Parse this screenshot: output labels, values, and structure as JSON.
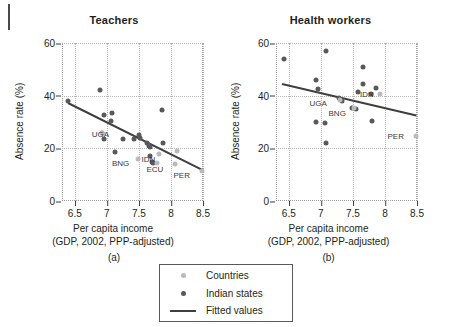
{
  "figure": {
    "legend": {
      "items": [
        {
          "label": "Countries",
          "marker": "dot",
          "color": "#b9babc"
        },
        {
          "label": "Indian states",
          "marker": "dot",
          "color": "#58595b"
        },
        {
          "label": "Fitted values",
          "marker": "line",
          "color": "#3f3f3f"
        }
      ]
    }
  },
  "chart_data": [
    {
      "type": "scatter",
      "title": "Teachers",
      "caption": "(a)",
      "xlabel": "Per capita income",
      "xlabel_line2": "(GDP, 2002, PPP-adjusted)",
      "ylabel": "Absence rate (%)",
      "xlim": [
        6.3,
        8.5
      ],
      "ylim": [
        0,
        60
      ],
      "xticks": [
        "6.5",
        "7",
        "7.5",
        "8",
        "8.5"
      ],
      "xtick_values": [
        6.5,
        7,
        7.5,
        8,
        8.5
      ],
      "yticks": [
        "0",
        "20",
        "40",
        "60"
      ],
      "ytick_values": [
        0,
        20,
        40,
        60
      ],
      "grid": "dotted",
      "series": [
        {
          "name": "Indian states",
          "color": "#58595b",
          "points": [
            {
              "x": 6.4,
              "y": 38.0
            },
            {
              "x": 6.9,
              "y": 42.0
            },
            {
              "x": 6.95,
              "y": 32.5
            },
            {
              "x": 7.08,
              "y": 33.5
            },
            {
              "x": 7.07,
              "y": 30.5
            },
            {
              "x": 6.93,
              "y": 26.0
            },
            {
              "x": 6.95,
              "y": 23.5
            },
            {
              "x": 7.12,
              "y": 18.5
            },
            {
              "x": 7.25,
              "y": 23.5
            },
            {
              "x": 7.42,
              "y": 23.5
            },
            {
              "x": 7.5,
              "y": 25.0
            },
            {
              "x": 7.52,
              "y": 24.0
            },
            {
              "x": 7.62,
              "y": 22.0
            },
            {
              "x": 7.66,
              "y": 21.0
            },
            {
              "x": 7.68,
              "y": 20.5
            },
            {
              "x": 7.68,
              "y": 17.0
            },
            {
              "x": 7.86,
              "y": 34.5
            },
            {
              "x": 7.88,
              "y": 22.0
            },
            {
              "x": 7.7,
              "y": 15.0
            },
            {
              "x": 7.72,
              "y": 14.3
            }
          ]
        },
        {
          "name": "Countries",
          "color": "#b9babc",
          "points": [
            {
              "x": 6.93,
              "y": 26.0,
              "label": "UGA",
              "label_dx": -2,
              "label_dy": 1
            },
            {
              "x": 7.48,
              "y": 16.0,
              "label": "BNG",
              "label_dx": -17,
              "label_dy": 4
            },
            {
              "x": 7.82,
              "y": 18.0,
              "label": "IDN",
              "label_dx": -11,
              "label_dy": 5
            },
            {
              "x": 7.78,
              "y": 14.5,
              "label": "ECU",
              "label_dx": -2,
              "label_dy": 6
            },
            {
              "x": 8.48,
              "y": 11.5,
              "label": "PER",
              "label_dx": -20,
              "label_dy": 4
            },
            {
              "x": 8.1,
              "y": 19.0
            },
            {
              "x": 8.07,
              "y": 14.0
            }
          ]
        }
      ],
      "fit_line": {
        "x1": 6.4,
        "y1": 37.5,
        "x2": 8.5,
        "y2": 12.0,
        "color": "#3f3f3f"
      }
    },
    {
      "type": "scatter",
      "title": "Health workers",
      "caption": "(b)",
      "xlabel": "Per capita income",
      "xlabel_line2": "(GDP, 2002, PPP-adjusted)",
      "ylabel": "Absence rate (%)",
      "xlim": [
        6.3,
        8.5
      ],
      "ylim": [
        0,
        60
      ],
      "xticks": [
        "6.5",
        "7",
        "7.5",
        "8",
        "8.5"
      ],
      "xtick_values": [
        6.5,
        7,
        7.5,
        8,
        8.5
      ],
      "yticks": [
        "0",
        "20",
        "40",
        "60"
      ],
      "ytick_values": [
        0,
        20,
        40,
        60
      ],
      "grid": "dotted",
      "series": [
        {
          "name": "Indian states",
          "color": "#58595b",
          "points": [
            {
              "x": 6.42,
              "y": 54.0
            },
            {
              "x": 7.08,
              "y": 57.0
            },
            {
              "x": 6.92,
              "y": 46.0
            },
            {
              "x": 6.96,
              "y": 42.5
            },
            {
              "x": 7.65,
              "y": 51.0
            },
            {
              "x": 7.66,
              "y": 44.5
            },
            {
              "x": 7.58,
              "y": 41.5
            },
            {
              "x": 7.78,
              "y": 40.5
            },
            {
              "x": 7.86,
              "y": 43.0
            },
            {
              "x": 7.28,
              "y": 39.0
            },
            {
              "x": 7.33,
              "y": 38.0
            },
            {
              "x": 7.48,
              "y": 35.5
            },
            {
              "x": 7.55,
              "y": 35.0
            },
            {
              "x": 6.92,
              "y": 30.0
            },
            {
              "x": 7.06,
              "y": 29.5
            },
            {
              "x": 7.8,
              "y": 30.5
            },
            {
              "x": 7.08,
              "y": 22.0
            }
          ]
        },
        {
          "name": "Countries",
          "color": "#b9babc",
          "points": [
            {
              "x": 7.3,
              "y": 38.5,
              "label": "UGA",
              "label_dx": -22,
              "label_dy": 3
            },
            {
              "x": 7.52,
              "y": 35.5,
              "label": "BNG",
              "label_dx": -17,
              "label_dy": 5
            },
            {
              "x": 7.92,
              "y": 40.5,
              "label": "IDN",
              "label_dx": -13,
              "label_dy": 0
            },
            {
              "x": 8.48,
              "y": 24.5,
              "label": "PER",
              "label_dx": -20,
              "label_dy": 0
            }
          ]
        }
      ],
      "fit_line": {
        "x1": 6.4,
        "y1": 45.0,
        "x2": 8.5,
        "y2": 33.0,
        "color": "#3f3f3f"
      }
    }
  ]
}
